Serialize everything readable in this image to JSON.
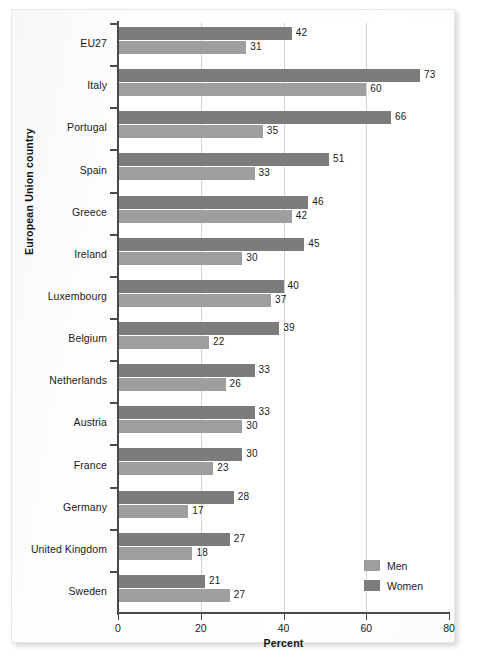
{
  "chart_data": {
    "type": "bar",
    "orientation": "horizontal",
    "title": "",
    "xlabel": "Percent",
    "ylabel": "European Union country",
    "xlim": [
      0,
      80
    ],
    "xticks": [
      0,
      20,
      40,
      60,
      80
    ],
    "grid": true,
    "grid_axis": "x",
    "legend_position": "bottom-right",
    "categories": [
      "EU27",
      "Italy",
      "Portugal",
      "Spain",
      "Greece",
      "Ireland",
      "Luxembourg",
      "Belgium",
      "Netherlands",
      "Austria",
      "France",
      "Germany",
      "United Kingdom",
      "Sweden"
    ],
    "series": [
      {
        "name": "Women",
        "color": "#7c7c7c",
        "values": [
          42,
          73,
          66,
          51,
          46,
          45,
          40,
          39,
          33,
          33,
          30,
          28,
          27,
          21
        ]
      },
      {
        "name": "Men",
        "color": "#9e9e9e",
        "values": [
          31,
          60,
          35,
          33,
          42,
          30,
          37,
          22,
          26,
          30,
          23,
          17,
          18,
          27
        ]
      }
    ]
  },
  "legend": {
    "items": [
      {
        "label": "Men",
        "color": "#9e9e9e"
      },
      {
        "label": "Women",
        "color": "#7c7c7c"
      }
    ]
  },
  "axis": {
    "x_title": "Percent",
    "y_title": "European Union country",
    "x_tick_labels": [
      "0",
      "20",
      "40",
      "60",
      "80"
    ]
  }
}
